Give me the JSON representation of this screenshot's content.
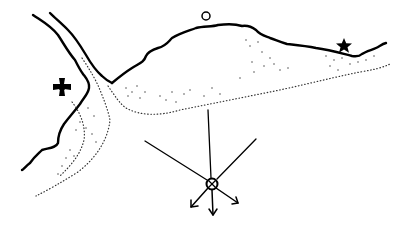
{
  "diagram": {
    "type": "hand-drawn map sketch",
    "symbols": [
      {
        "name": "cross-pattee",
        "icon": "maltese-cross-icon",
        "x": 62,
        "y": 87,
        "color": "#000000"
      },
      {
        "name": "circle",
        "icon": "circle-icon",
        "x": 206,
        "y": 16,
        "color": "#000000"
      },
      {
        "name": "star",
        "icon": "star-icon",
        "x": 344,
        "y": 46,
        "color": "#000000"
      }
    ],
    "compass": {
      "center": {
        "x": 212,
        "y": 184
      },
      "rays_to": [
        [
          145,
          141
        ],
        [
          208,
          110
        ],
        [
          256,
          139
        ]
      ],
      "arrows_to": [
        [
          191,
          208
        ],
        [
          214,
          216
        ],
        [
          239,
          203
        ]
      ]
    },
    "colors": {
      "ink": "#000000",
      "background": "#ffffff"
    }
  }
}
